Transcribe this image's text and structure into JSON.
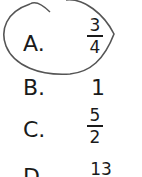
{
  "options": [
    {
      "letter": "A.",
      "num": "3",
      "den": "4"
    },
    {
      "letter": "B.",
      "value": "1"
    },
    {
      "letter": "C.",
      "num": "5",
      "den": "2"
    },
    {
      "letter": "D.",
      "num": "13"
    }
  ],
  "annotation": {
    "type": "hand-drawn circle around option A",
    "color": "#555555"
  }
}
